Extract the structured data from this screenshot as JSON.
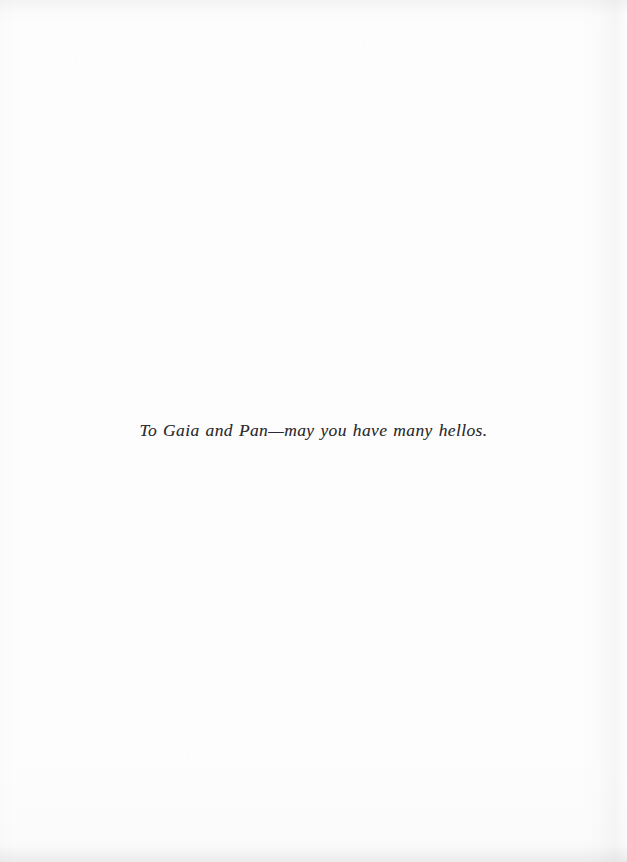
{
  "page": {
    "kind": "book-dedication-page",
    "paper_color": "#fdfdfd",
    "ink_color": "#2b2b2d"
  },
  "dedication": {
    "text": "To Gaia and Pan—may you have many hellos."
  }
}
